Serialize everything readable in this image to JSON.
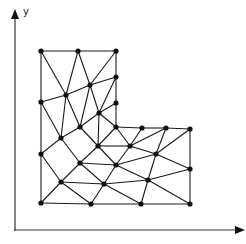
{
  "diagram": {
    "title": "",
    "type": "finite-element-triangular-mesh",
    "axes": {
      "y_label": "y",
      "x_label": ""
    },
    "nodes": [
      [
        41,
        51
      ],
      [
        78,
        51
      ],
      [
        116,
        51
      ],
      [
        116,
        77
      ],
      [
        90,
        85
      ],
      [
        66,
        95
      ],
      [
        41,
        102
      ],
      [
        116,
        103
      ],
      [
        99,
        113
      ],
      [
        80,
        127
      ],
      [
        116,
        127
      ],
      [
        142,
        128
      ],
      [
        166,
        128
      ],
      [
        190,
        129
      ],
      [
        61,
        138
      ],
      [
        98,
        146
      ],
      [
        130,
        146
      ],
      [
        41,
        154
      ],
      [
        156,
        154
      ],
      [
        80,
        163
      ],
      [
        116,
        165
      ],
      [
        190,
        169
      ],
      [
        148,
        180
      ],
      [
        61,
        182
      ],
      [
        104,
        184
      ],
      [
        41,
        203
      ],
      [
        91,
        204
      ],
      [
        141,
        204
      ],
      [
        190,
        204
      ]
    ],
    "edges": [
      [
        0,
        1
      ],
      [
        1,
        2
      ],
      [
        0,
        6
      ],
      [
        2,
        3
      ],
      [
        0,
        5
      ],
      [
        1,
        5
      ],
      [
        1,
        4
      ],
      [
        2,
        4
      ],
      [
        6,
        5
      ],
      [
        5,
        4
      ],
      [
        4,
        3
      ],
      [
        3,
        7
      ],
      [
        4,
        8
      ],
      [
        3,
        8
      ],
      [
        7,
        8
      ],
      [
        5,
        9
      ],
      [
        4,
        9
      ],
      [
        5,
        14
      ],
      [
        6,
        14
      ],
      [
        8,
        9
      ],
      [
        8,
        15
      ],
      [
        7,
        10
      ],
      [
        8,
        10
      ],
      [
        10,
        15
      ],
      [
        10,
        16
      ],
      [
        15,
        16
      ],
      [
        10,
        11
      ],
      [
        11,
        12
      ],
      [
        12,
        13
      ],
      [
        11,
        16
      ],
      [
        16,
        12
      ],
      [
        9,
        14
      ],
      [
        9,
        15
      ],
      [
        14,
        17
      ],
      [
        14,
        19
      ],
      [
        6,
        17
      ],
      [
        15,
        19
      ],
      [
        15,
        20
      ],
      [
        16,
        20
      ],
      [
        16,
        18
      ],
      [
        12,
        18
      ],
      [
        13,
        18
      ],
      [
        13,
        21
      ],
      [
        20,
        18
      ],
      [
        18,
        21
      ],
      [
        19,
        20
      ],
      [
        19,
        23
      ],
      [
        19,
        24
      ],
      [
        17,
        23
      ],
      [
        17,
        25
      ],
      [
        23,
        25
      ],
      [
        23,
        26
      ],
      [
        23,
        24
      ],
      [
        20,
        24
      ],
      [
        20,
        22
      ],
      [
        24,
        22
      ],
      [
        18,
        22
      ],
      [
        22,
        21
      ],
      [
        22,
        27
      ],
      [
        22,
        28
      ],
      [
        24,
        26
      ],
      [
        24,
        27
      ],
      [
        26,
        27
      ],
      [
        27,
        28
      ],
      [
        21,
        28
      ],
      [
        25,
        26
      ]
    ]
  }
}
